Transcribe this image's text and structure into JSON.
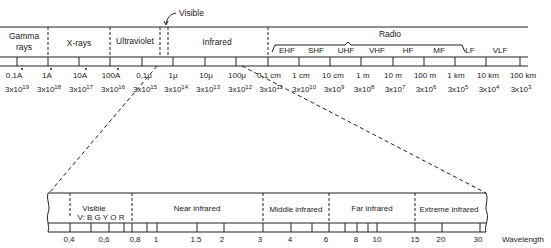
{
  "top_spectrum": {
    "regions": [
      {
        "label_line1": "Gamma",
        "label_line2": "rays"
      },
      {
        "label": "X-rays"
      },
      {
        "label": "Ultraviolet"
      },
      {
        "label": "Infrared"
      },
      {
        "label": "Radio"
      }
    ],
    "visible_callout": "Visible",
    "radio_bands": [
      "EHF",
      "SHF",
      "UHF",
      "VHF",
      "HF",
      "MF",
      "LF",
      "VLF"
    ],
    "wavelengths": [
      "0,1A",
      "1A",
      "10A",
      "100A",
      "0,1μ",
      "1μ",
      "10μ",
      "100μ",
      "0,1 cm",
      "1 cm",
      "10 cm",
      "1 m",
      "10 m",
      "100 m",
      "1 km",
      "10 km",
      "100 km"
    ],
    "frequencies": [
      {
        "base": "3x10",
        "exp": "19"
      },
      {
        "base": "3x10",
        "exp": "18"
      },
      {
        "base": "3x10",
        "exp": "17"
      },
      {
        "base": "3x10",
        "exp": "16"
      },
      {
        "base": "3x10",
        "exp": "15"
      },
      {
        "base": "3x10",
        "exp": "14"
      },
      {
        "base": "3x10",
        "exp": "13"
      },
      {
        "base": "3x10",
        "exp": "12"
      },
      {
        "base": "3x10",
        "exp": "11"
      },
      {
        "base": "3x10",
        "exp": "10"
      },
      {
        "base": "3x10",
        "exp": "9"
      },
      {
        "base": "3x10",
        "exp": "8"
      },
      {
        "base": "3x10",
        "exp": "7"
      },
      {
        "base": "3x10",
        "exp": "6"
      },
      {
        "base": "3x10",
        "exp": "5"
      },
      {
        "base": "3x10",
        "exp": "4"
      },
      {
        "base": "3x10",
        "exp": "3"
      }
    ]
  },
  "bottom_detail": {
    "regions": [
      {
        "label": "Visible",
        "sub": "V: B G Y O R"
      },
      {
        "label": "Near infrared"
      },
      {
        "label": "Middle infrared"
      },
      {
        "label": "Far infrared"
      },
      {
        "label": "Extreme infrared"
      }
    ],
    "ticks": [
      "0,4",
      "0,6",
      "0,8",
      "1",
      "1.5",
      "2",
      "3",
      "4",
      "6",
      "8",
      "10",
      "15",
      "20",
      "30"
    ],
    "axis_label": "Wavelength"
  }
}
